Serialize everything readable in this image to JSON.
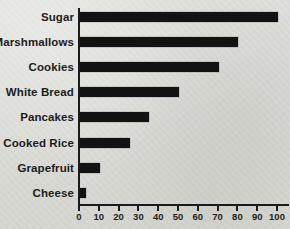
{
  "chart_data": {
    "type": "bar",
    "orientation": "horizontal",
    "title": "",
    "xlabel": "",
    "ylabel": "",
    "categories": [
      "Sugar",
      "Marshmallows",
      "Cookies",
      "White Bread",
      "Pancakes",
      "Cooked Rice",
      "Grapefruit",
      "Cheese"
    ],
    "values": [
      100,
      80,
      70,
      50,
      35,
      25,
      10,
      3
    ],
    "xlim": [
      0,
      100
    ],
    "xticks": [
      0,
      10,
      20,
      30,
      40,
      50,
      60,
      70,
      80,
      90,
      100
    ],
    "grid": false,
    "legend": false,
    "bar_color": "#121212",
    "axis_color": "#1b1b1b",
    "background_color": "#dbdbd7"
  }
}
